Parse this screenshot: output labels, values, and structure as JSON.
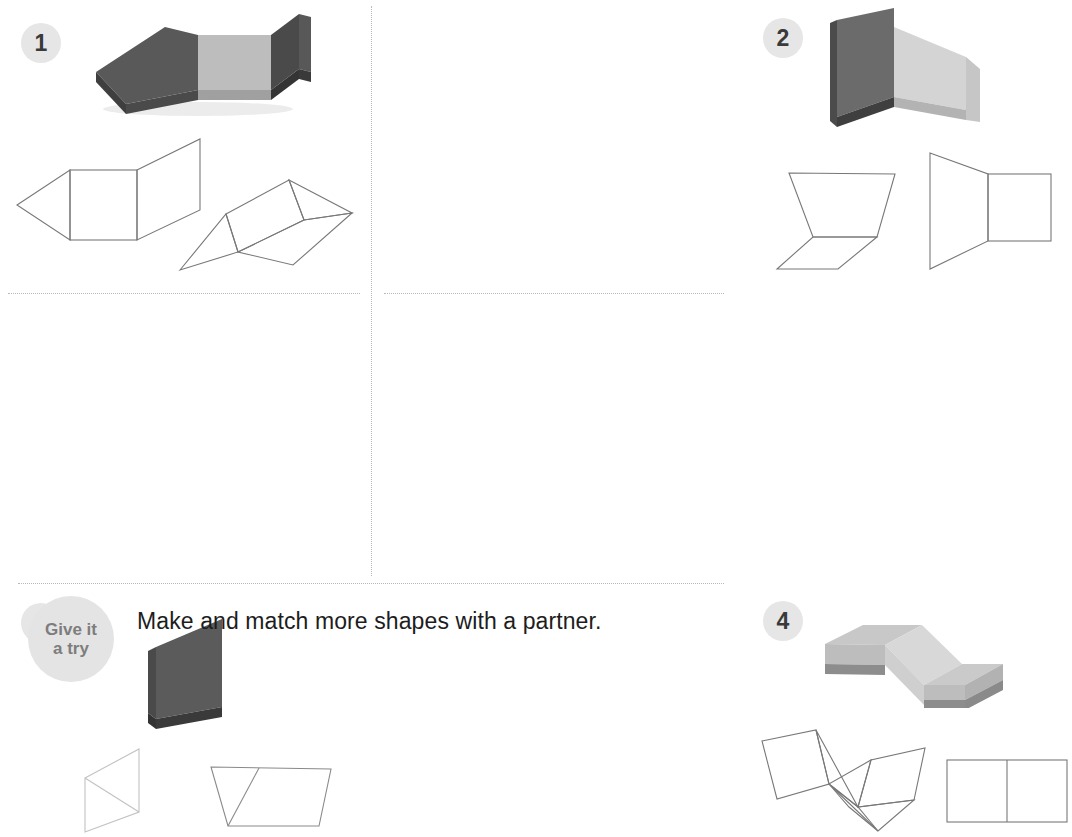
{
  "page": {
    "background_color": "#ffffff",
    "divider_color": "#b9b9b9",
    "width": 731,
    "height": 662
  },
  "badges": {
    "color_bg": "#e6e6e6",
    "color_text": "#3a3a3a",
    "items": [
      {
        "label": "1"
      },
      {
        "label": "2"
      },
      {
        "label": "3"
      },
      {
        "label": "4"
      }
    ]
  },
  "palette": {
    "foam_light_top": "#c2c2c2",
    "foam_light_face": "#b4b4b4",
    "foam_light_edge": "#9b9b9b",
    "foam_mid": "#8e8e8e",
    "foam_dark_top": "#5e5e5e",
    "foam_dark_face": "#4f4f4f",
    "foam_dark_edge": "#3a3a3a",
    "foam_darker": "#3f3f3f",
    "net_line": "#6e6e6e",
    "net_line_light": "#bdbdbd",
    "shadow": "#e9e9e9"
  },
  "problems": [
    {
      "number": "1",
      "solid_description": "three-panel folded foam prism, dark-light-dark",
      "nets": [
        {
          "name": "net-pentagon-fold",
          "description": "triangle, square and parallelogram folded net"
        },
        {
          "name": "net-hexagon-fold",
          "description": "rotated three-face net with two end triangles"
        }
      ]
    },
    {
      "number": "2",
      "solid_description": "two foam panels meeting at a right angle, dark and light",
      "nets": [
        {
          "name": "net-trapezoid-parallelogram",
          "description": "trapezoid with attached parallelogram base"
        },
        {
          "name": "net-trapezoid-square",
          "description": "trapezoid with attached square"
        }
      ]
    },
    {
      "number": "3",
      "solid_description": "single dark foam trapezoidal panel",
      "nets": [
        {
          "name": "net-parallelogram-diagonal",
          "description": "parallelogram split by a diagonal"
        },
        {
          "name": "net-trapezoid-split",
          "description": "wide trapezoid split into triangle and trapezoid"
        }
      ]
    },
    {
      "number": "4",
      "solid_description": "three light foam square panels in a zigzag arrangement",
      "nets": [
        {
          "name": "net-zigzag-squares",
          "description": "three squares folded in a zigzag"
        },
        {
          "name": "net-two-squares",
          "description": "two squares side by side"
        }
      ]
    }
  ],
  "footer": {
    "badge_line1": "Give it",
    "badge_line2": "a try",
    "badge_bg": "#e4e4e4",
    "badge_text_color": "#7d7d7d",
    "instruction": "Make and match more shapes with a partner."
  }
}
